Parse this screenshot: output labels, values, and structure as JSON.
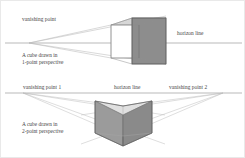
{
  "figure": {
    "background_color": "#ffffff",
    "border_color": "#e9e9e9",
    "width": 245,
    "height": 158
  },
  "style": {
    "horizon_line_color": "#8a8a8a",
    "construction_line_color": "#b4b4b4",
    "cube_edge_color": "#6b6b6b",
    "cube_face_dark": "#878787",
    "cube_face_mid": "#9a9a9a",
    "cube_face_light": "#c9c9c9",
    "text_color": "#454545"
  },
  "panels": [
    {
      "id": "one-point",
      "name": "one-point-perspective-diagram",
      "vanishing_point_label": "vanishing point",
      "horizon_label": "horizon line",
      "caption_line_1": "A cube drawn in",
      "caption_line_2": "1-point perspective",
      "vanishing_points": 1
    },
    {
      "id": "two-point",
      "name": "two-point-perspective-diagram",
      "vanishing_point_1_label": "vanishing point 1",
      "vanishing_point_2_label": "vanishing point 2",
      "horizon_label": "horizon line",
      "caption_line_1": "A cube drawn in",
      "caption_line_2": "2-point perspective",
      "vanishing_points": 2
    }
  ]
}
